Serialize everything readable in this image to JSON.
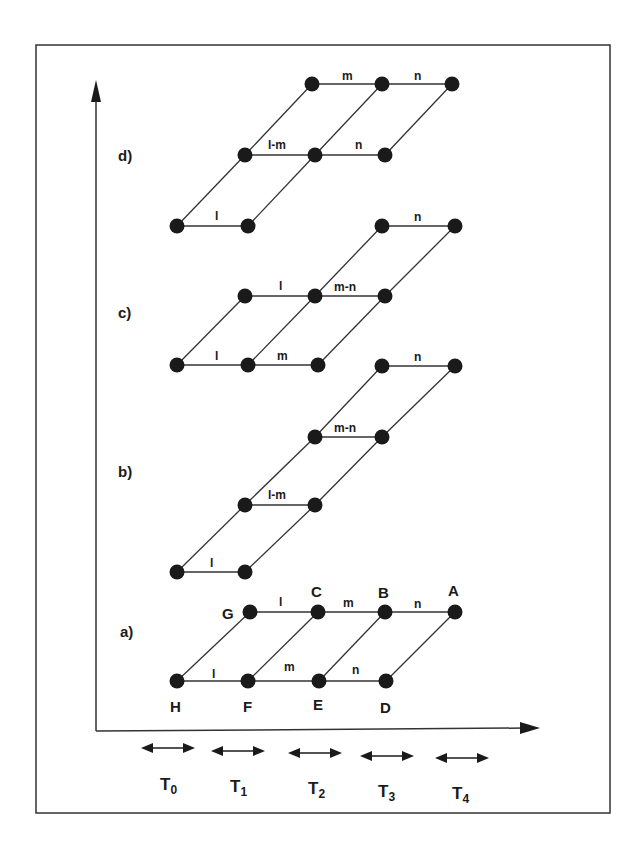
{
  "diagram": {
    "panels": [
      {
        "id": "a",
        "label": "a)",
        "label_pos": [
          120,
          637
        ],
        "nodes": [
          {
            "id": "H",
            "x": 177,
            "y": 681,
            "label": "H",
            "lx": 170,
            "ly": 712
          },
          {
            "id": "F",
            "x": 248,
            "y": 681,
            "label": "F",
            "lx": 243,
            "ly": 712
          },
          {
            "id": "E",
            "x": 319,
            "y": 681,
            "label": "E",
            "lx": 313,
            "ly": 710
          },
          {
            "id": "D",
            "x": 386,
            "y": 681,
            "label": "D",
            "lx": 380,
            "ly": 713
          },
          {
            "id": "G",
            "x": 250,
            "y": 612,
            "label": "G",
            "lx": 222,
            "ly": 619
          },
          {
            "id": "C",
            "x": 318,
            "y": 612,
            "label": "C",
            "lx": 311,
            "ly": 597
          },
          {
            "id": "B",
            "x": 385,
            "y": 612,
            "label": "B",
            "lx": 378,
            "ly": 598
          },
          {
            "id": "A",
            "x": 455,
            "y": 612,
            "label": "A",
            "lx": 448,
            "ly": 596
          }
        ],
        "edges": [
          {
            "from": "H",
            "to": "F",
            "label": "l",
            "lx": 212,
            "ly": 678
          },
          {
            "from": "F",
            "to": "E",
            "label": "m",
            "lx": 284,
            "ly": 671
          },
          {
            "from": "E",
            "to": "D",
            "label": "n",
            "lx": 352,
            "ly": 674
          },
          {
            "from": "G",
            "to": "C",
            "label": "l",
            "lx": 279,
            "ly": 606
          },
          {
            "from": "C",
            "to": "B",
            "label": "m",
            "lx": 343,
            "ly": 607
          },
          {
            "from": "B",
            "to": "A",
            "label": "n",
            "lx": 414,
            "ly": 608
          },
          {
            "from": "H",
            "to": "G"
          },
          {
            "from": "F",
            "to": "C"
          },
          {
            "from": "E",
            "to": "B"
          },
          {
            "from": "D",
            "to": "A"
          }
        ]
      },
      {
        "id": "b",
        "label": "b)",
        "label_pos": [
          118,
          477
        ],
        "nodes": [
          {
            "id": "b1",
            "x": 177,
            "y": 572
          },
          {
            "id": "b2",
            "x": 245,
            "y": 572
          },
          {
            "id": "b3",
            "x": 245,
            "y": 505
          },
          {
            "id": "b4",
            "x": 315,
            "y": 505
          },
          {
            "id": "b5",
            "x": 315,
            "y": 437
          },
          {
            "id": "b6",
            "x": 382,
            "y": 437
          },
          {
            "id": "b7",
            "x": 382,
            "y": 366
          },
          {
            "id": "b8",
            "x": 455,
            "y": 366
          }
        ],
        "edges": [
          {
            "from": "b1",
            "to": "b2",
            "label": "l",
            "lx": 210,
            "ly": 567
          },
          {
            "from": "b3",
            "to": "b4",
            "label": "l-m",
            "lx": 268,
            "ly": 499
          },
          {
            "from": "b5",
            "to": "b6",
            "label": "m-n",
            "lx": 334,
            "ly": 432
          },
          {
            "from": "b7",
            "to": "b8",
            "label": "n",
            "lx": 414,
            "ly": 361
          },
          {
            "from": "b1",
            "to": "b3"
          },
          {
            "from": "b3",
            "to": "b5"
          },
          {
            "from": "b5",
            "to": "b7"
          },
          {
            "from": "b2",
            "to": "b4"
          },
          {
            "from": "b4",
            "to": "b6"
          },
          {
            "from": "b6",
            "to": "b8"
          }
        ]
      },
      {
        "id": "c",
        "label": "c)",
        "label_pos": [
          118,
          318
        ],
        "nodes": [
          {
            "id": "c1",
            "x": 177,
            "y": 365
          },
          {
            "id": "c2",
            "x": 248,
            "y": 365
          },
          {
            "id": "c3",
            "x": 318,
            "y": 365
          },
          {
            "id": "c4",
            "x": 245,
            "y": 296
          },
          {
            "id": "c5",
            "x": 315,
            "y": 296
          },
          {
            "id": "c6",
            "x": 385,
            "y": 296
          },
          {
            "id": "c7",
            "x": 382,
            "y": 226
          },
          {
            "id": "c8",
            "x": 455,
            "y": 226
          }
        ],
        "edges": [
          {
            "from": "c1",
            "to": "c2",
            "label": "l",
            "lx": 215,
            "ly": 360
          },
          {
            "from": "c2",
            "to": "c3",
            "label": "m",
            "lx": 277,
            "ly": 360
          },
          {
            "from": "c4",
            "to": "c5",
            "label": "l",
            "lx": 279,
            "ly": 290
          },
          {
            "from": "c5",
            "to": "c6",
            "label": "m-n",
            "lx": 334,
            "ly": 291
          },
          {
            "from": "c7",
            "to": "c8",
            "label": "n",
            "lx": 414,
            "ly": 221
          },
          {
            "from": "c1",
            "to": "c4"
          },
          {
            "from": "c2",
            "to": "c5"
          },
          {
            "from": "c3",
            "to": "c6"
          },
          {
            "from": "c5",
            "to": "c7"
          },
          {
            "from": "c6",
            "to": "c8"
          }
        ]
      },
      {
        "id": "d",
        "label": "d)",
        "label_pos": [
          118,
          161
        ],
        "nodes": [
          {
            "id": "d1",
            "x": 177,
            "y": 226
          },
          {
            "id": "d2",
            "x": 248,
            "y": 226
          },
          {
            "id": "d3",
            "x": 245,
            "y": 155
          },
          {
            "id": "d4",
            "x": 315,
            "y": 155
          },
          {
            "id": "d5",
            "x": 385,
            "y": 155
          },
          {
            "id": "d6",
            "x": 312,
            "y": 84
          },
          {
            "id": "d7",
            "x": 382,
            "y": 84
          },
          {
            "id": "d8",
            "x": 452,
            "y": 84
          }
        ],
        "edges": [
          {
            "from": "d1",
            "to": "d2",
            "label": "l",
            "lx": 215,
            "ly": 220
          },
          {
            "from": "d3",
            "to": "d4",
            "label": "l-m",
            "lx": 268,
            "ly": 149
          },
          {
            "from": "d4",
            "to": "d5",
            "label": "n",
            "lx": 355,
            "ly": 149
          },
          {
            "from": "d6",
            "to": "d7",
            "label": "m",
            "lx": 342,
            "ly": 80
          },
          {
            "from": "d7",
            "to": "d8",
            "label": "n",
            "lx": 414,
            "ly": 80
          },
          {
            "from": "d1",
            "to": "d3"
          },
          {
            "from": "d2",
            "to": "d4"
          },
          {
            "from": "d3",
            "to": "d6"
          },
          {
            "from": "d4",
            "to": "d7"
          },
          {
            "from": "d5",
            "to": "d8"
          }
        ]
      }
    ],
    "time_intervals": [
      {
        "label": "T",
        "sub": "0",
        "x": 168,
        "y": 748,
        "tx": 160,
        "ty": 790
      },
      {
        "label": "T",
        "sub": "1",
        "x": 238,
        "y": 751,
        "tx": 230,
        "ty": 792
      },
      {
        "label": "T",
        "sub": "2",
        "x": 315,
        "y": 753,
        "tx": 308,
        "ty": 794
      },
      {
        "label": "T",
        "sub": "3",
        "x": 387,
        "y": 756,
        "tx": 378,
        "ty": 797
      },
      {
        "label": "T",
        "sub": "4",
        "x": 462,
        "y": 758,
        "tx": 452,
        "ty": 799
      }
    ],
    "axes": {
      "origin": [
        96,
        731
      ],
      "y_top": 80,
      "x_right": 540
    },
    "frame": {
      "x": 36,
      "y": 45,
      "w": 574,
      "h": 768
    },
    "colors": {
      "ink": "#1a1a1a",
      "line": "#333333",
      "background": "#ffffff"
    }
  }
}
